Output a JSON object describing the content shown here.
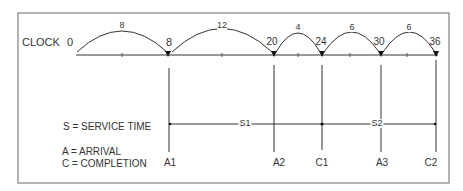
{
  "diagram": {
    "clock_label": "CLOCK",
    "ticks": [
      {
        "value": "0",
        "x": 70
      },
      {
        "value": "8",
        "x": 169
      },
      {
        "value": "20",
        "x": 274
      },
      {
        "value": "24",
        "x": 322
      },
      {
        "value": "30",
        "x": 381
      },
      {
        "value": "36",
        "x": 436
      }
    ],
    "intervals": [
      {
        "label": "8",
        "from": 77,
        "to": 169
      },
      {
        "label": "12",
        "from": 172,
        "to": 274
      },
      {
        "label": "4",
        "from": 276,
        "to": 322
      },
      {
        "label": "6",
        "from": 324,
        "to": 381
      },
      {
        "label": "6",
        "from": 383,
        "to": 436
      }
    ],
    "events": [
      {
        "label": "A1",
        "x": 169
      },
      {
        "label": "A2",
        "x": 274
      },
      {
        "label": "C1",
        "x": 322
      },
      {
        "label": "A3",
        "x": 381
      },
      {
        "label": "C2",
        "x": 436
      }
    ],
    "service": [
      {
        "label": "S1",
        "from": 169,
        "to": 322
      },
      {
        "label": "S2",
        "from": 322,
        "to": 436
      }
    ],
    "legend": {
      "service": "S = SERVICE TIME",
      "arrival": "A = ARRIVAL",
      "completion": "C = COMPLETION"
    },
    "colors": {
      "line": "#333333",
      "frame": "#666666"
    }
  }
}
